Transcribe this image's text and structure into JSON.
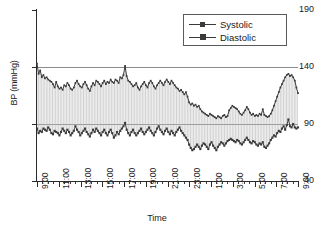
{
  "chart_data": {
    "type": "line",
    "title": "",
    "xlabel": "Time",
    "ylabel": "BP (mmHg)",
    "ylim": [
      40,
      190
    ],
    "yticks": [
      40,
      90,
      140,
      190
    ],
    "gridlines": [
      90,
      140
    ],
    "grid": true,
    "legend_position": "top-right",
    "x_tick_labels": [
      "9:00",
      "11:00",
      "13:00",
      "15:00",
      "17:00",
      "19:00",
      "21:00",
      "23:00",
      "1:00",
      "3:00",
      "5:00",
      "7:00",
      "9:00"
    ],
    "x_minor_tick_interval_minutes": 30,
    "x_major_tick_interval_hours": 2,
    "x_start_hour": 9,
    "x_end_hour": 33,
    "x_sample_interval_minutes": 15,
    "fill_between_series": true,
    "fill_pattern": "vertical-hatch",
    "series": [
      {
        "name": "Systolic",
        "marker": "square-small",
        "color": "#3a3a3a",
        "values": [
          143,
          134,
          137,
          131,
          133,
          130,
          131,
          129,
          128,
          127,
          125,
          122,
          127,
          123,
          121,
          122,
          120,
          124,
          123,
          126,
          124,
          121,
          120,
          122,
          126,
          128,
          125,
          123,
          122,
          125,
          127,
          124,
          121,
          119,
          123,
          126,
          124,
          128,
          127,
          125,
          123,
          126,
          128,
          125,
          127,
          126,
          129,
          127,
          126,
          129,
          128,
          126,
          131,
          130,
          133,
          141,
          132,
          128,
          127,
          125,
          123,
          124,
          126,
          122,
          120,
          123,
          125,
          127,
          124,
          122,
          126,
          128,
          126,
          123,
          121,
          124,
          126,
          128,
          126,
          124,
          127,
          129,
          127,
          125,
          128,
          126,
          124,
          122,
          121,
          119,
          120,
          118,
          116,
          118,
          114,
          109,
          107,
          108,
          106,
          107,
          105,
          106,
          103,
          101,
          100,
          99,
          98,
          97,
          99,
          98,
          97,
          96,
          95,
          97,
          96,
          95,
          97,
          98,
          96,
          97,
          102,
          104,
          106,
          105,
          104,
          103,
          101,
          99,
          98,
          100,
          102,
          105,
          103,
          100,
          98,
          99,
          97,
          98,
          97,
          99,
          98,
          103,
          98,
          97,
          96,
          97,
          99,
          102,
          106,
          110,
          114,
          118,
          122,
          125,
          128,
          131,
          133,
          134,
          132,
          133,
          131,
          128,
          122,
          117
        ]
      },
      {
        "name": "Diastolic",
        "marker": "square",
        "color": "#3a3a3a",
        "values": [
          86,
          82,
          84,
          83,
          86,
          85,
          84,
          87,
          85,
          82,
          81,
          84,
          83,
          82,
          80,
          83,
          86,
          84,
          82,
          85,
          83,
          80,
          82,
          84,
          88,
          85,
          83,
          80,
          82,
          84,
          86,
          83,
          81,
          79,
          82,
          85,
          83,
          86,
          84,
          82,
          80,
          83,
          85,
          82,
          80,
          83,
          85,
          82,
          78,
          80,
          83,
          81,
          84,
          86,
          88,
          91,
          85,
          82,
          80,
          83,
          85,
          82,
          80,
          82,
          84,
          86,
          83,
          81,
          83,
          85,
          87,
          84,
          82,
          80,
          83,
          86,
          88,
          85,
          83,
          81,
          84,
          86,
          83,
          81,
          84,
          82,
          80,
          83,
          85,
          87,
          84,
          82,
          80,
          78,
          76,
          72,
          69,
          67,
          68,
          70,
          72,
          70,
          68,
          71,
          73,
          72,
          70,
          68,
          72,
          74,
          71,
          69,
          67,
          70,
          72,
          74,
          73,
          71,
          73,
          75,
          76,
          77,
          76,
          75,
          74,
          76,
          75,
          73,
          72,
          74,
          76,
          78,
          76,
          74,
          73,
          75,
          74,
          72,
          71,
          73,
          72,
          74,
          70,
          69,
          71,
          73,
          76,
          78,
          80,
          79,
          82,
          84,
          83,
          86,
          88,
          85,
          89,
          94,
          88,
          87,
          90,
          87,
          86,
          87
        ]
      }
    ]
  },
  "legend": {
    "items": [
      {
        "label": "Systolic"
      },
      {
        "label": "Diastolic"
      }
    ]
  },
  "axes": {
    "y_title": "BP (mmHg)",
    "x_title": "Time"
  }
}
